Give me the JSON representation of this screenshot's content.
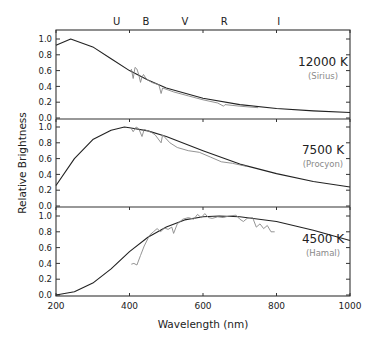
{
  "chart_data": {
    "type": "line",
    "title": "",
    "xlabel": "Wavelength (nm)",
    "ylabel": "Relative Brightness",
    "xlim": [
      200,
      1000
    ],
    "x_ticks": [
      200,
      400,
      600,
      800,
      1000
    ],
    "y_ticks": [
      "0.0",
      "0.2",
      "0.4",
      "0.6",
      "0.8",
      "1.0"
    ],
    "ylim": [
      0,
      1.1
    ],
    "grid": false,
    "top_band_labels": [
      {
        "label": "U",
        "x": 365
      },
      {
        "label": "B",
        "x": 445
      },
      {
        "label": "V",
        "x": 551
      },
      {
        "label": "R",
        "x": 658
      },
      {
        "label": "I",
        "x": 806
      }
    ],
    "panels": [
      {
        "temperature_label": "12000 K",
        "star_label": "(Sirius)",
        "temperature_K": 12000,
        "series": [
          {
            "name": "Blackbody 12000 K",
            "type": "model",
            "x": [
              200,
              240,
              300,
              350,
              400,
              450,
              500,
              600,
              700,
              800,
              900,
              1000
            ],
            "y": [
              0.92,
              1.0,
              0.9,
              0.75,
              0.6,
              0.48,
              0.38,
              0.25,
              0.17,
              0.12,
              0.09,
              0.07
            ]
          },
          {
            "name": "Sirius observed",
            "type": "observed",
            "x": [
              405,
              410,
              415,
              420,
              425,
              430,
              434,
              438,
              445,
              460,
              480,
              486,
              490,
              520,
              560,
              600,
              640,
              656,
              660,
              700,
              750
            ],
            "y": [
              0.62,
              0.5,
              0.64,
              0.62,
              0.55,
              0.45,
              0.52,
              0.55,
              0.5,
              0.45,
              0.42,
              0.31,
              0.38,
              0.33,
              0.28,
              0.23,
              0.19,
              0.15,
              0.17,
              0.15,
              0.13
            ]
          }
        ]
      },
      {
        "temperature_label": "7500 K",
        "star_label": "(Procyon)",
        "temperature_K": 7500,
        "series": [
          {
            "name": "Blackbody 7500 K",
            "type": "model",
            "x": [
              200,
              250,
              300,
              350,
              386,
              400,
              450,
              500,
              600,
              700,
              800,
              900,
              1000
            ],
            "y": [
              0.26,
              0.6,
              0.84,
              0.96,
              1.0,
              0.99,
              0.95,
              0.88,
              0.7,
              0.53,
              0.41,
              0.31,
              0.24
            ]
          },
          {
            "name": "Procyon observed",
            "type": "observed",
            "x": [
              405,
              410,
              418,
              425,
              434,
              440,
              460,
              470,
              486,
              490,
              510,
              530,
              560,
              590,
              620,
              650,
              680,
              700,
              720
            ],
            "y": [
              0.98,
              0.94,
              1.0,
              0.98,
              0.88,
              0.97,
              0.93,
              0.9,
              0.8,
              0.9,
              0.8,
              0.74,
              0.7,
              0.68,
              0.62,
              0.56,
              0.54,
              0.52,
              0.5
            ]
          }
        ]
      },
      {
        "temperature_label": "4500 K",
        "star_label": "(Hamal)",
        "temperature_K": 4500,
        "series": [
          {
            "name": "Blackbody 4500 K",
            "type": "model",
            "x": [
              200,
              250,
              300,
              350,
              400,
              450,
              500,
              550,
              600,
              644,
              700,
              800,
              900,
              1000
            ],
            "y": [
              0.0,
              0.04,
              0.15,
              0.33,
              0.55,
              0.73,
              0.86,
              0.95,
              0.99,
              1.0,
              0.99,
              0.93,
              0.82,
              0.69
            ]
          },
          {
            "name": "Hamal observed",
            "type": "observed",
            "x": [
              405,
              412,
              420,
              430,
              440,
              455,
              465,
              475,
              485,
              495,
              505,
              515,
              520,
              530,
              545,
              560,
              575,
              585,
              595,
              605,
              615,
              625,
              640,
              655,
              670,
              690,
              700,
              710,
              720,
              735,
              745,
              755,
              765,
              775,
              785,
              795
            ],
            "y": [
              0.39,
              0.4,
              0.38,
              0.5,
              0.62,
              0.76,
              0.8,
              0.84,
              0.8,
              0.85,
              0.83,
              0.86,
              0.78,
              0.9,
              0.96,
              0.98,
              0.96,
              1.02,
              0.98,
              1.03,
              0.98,
              0.97,
              0.99,
              0.98,
              1.0,
              1.01,
              0.96,
              0.93,
              0.97,
              0.98,
              0.86,
              0.9,
              0.84,
              0.88,
              0.8,
              0.8
            ]
          }
        ]
      }
    ]
  },
  "colors": {
    "axis": "#333333",
    "model_line": "#222222",
    "observed_line": "#888888",
    "temperature_text": "#222222",
    "star_text": "#8a8a8a"
  }
}
